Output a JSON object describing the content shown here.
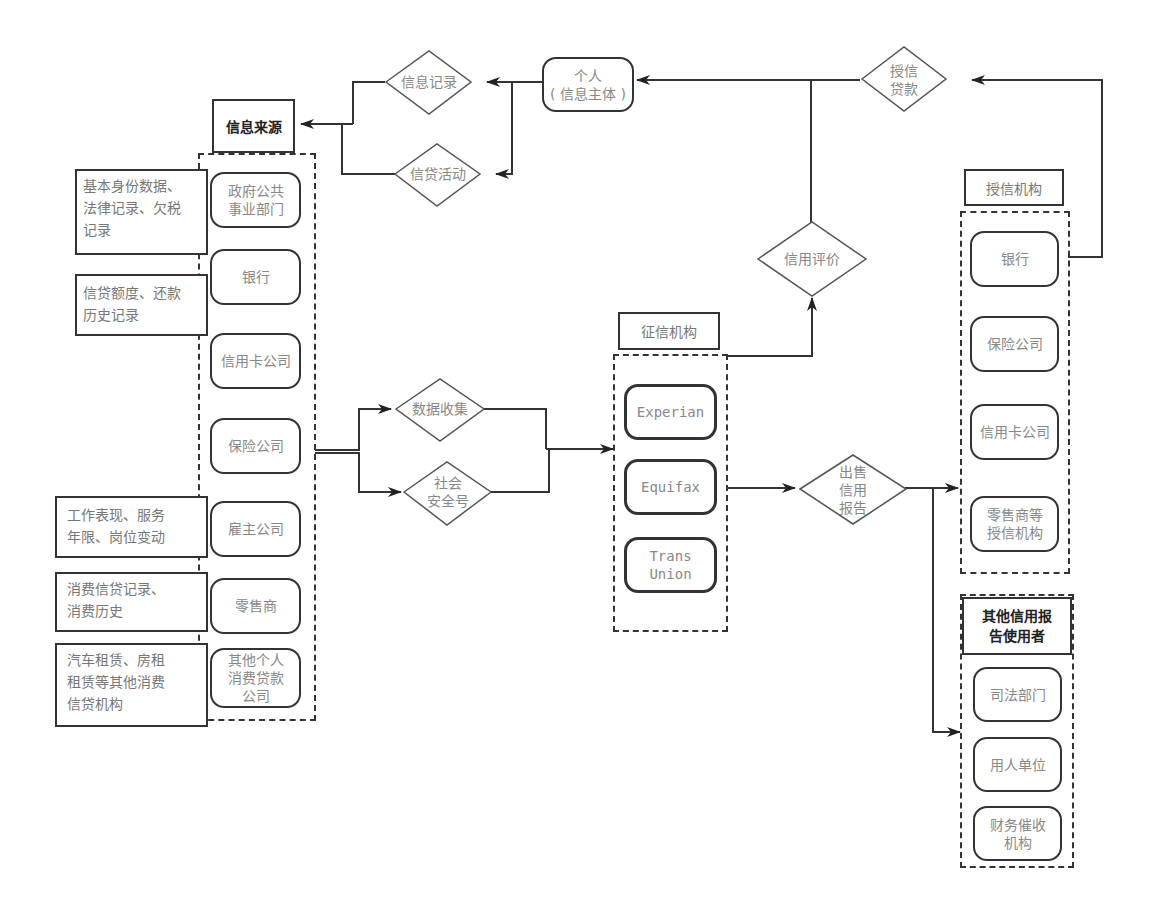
{
  "diagram": {
    "individual": {
      "label": "个人\n( 信息主体 )"
    },
    "decisions": {
      "info_record": "信息记录",
      "credit_activity": "信贷活动",
      "grant_loan": "授信\n贷款",
      "credit_rating": "信用评价",
      "data_collection": "数据收集",
      "ssn": "社会\n安全号",
      "sell_report": "出售\n信用\n报告"
    },
    "info_sources": {
      "title": "信息来源",
      "items": [
        "政府公共\n事业部门",
        "银行",
        "信用卡公司",
        "保险公司",
        "雇主公司",
        "零售商",
        "其他个人\n消费贷款\n公司"
      ],
      "notes": [
        "基本身份数据、\n法律记录、欠税\n记录",
        "信贷额度、还款\n历史记录",
        "工作表现、服务\n年限、岗位变动",
        "消费信贷记录、\n消费历史",
        "汽车租赁、房租\n租赁等其他消费\n信贷机构"
      ]
    },
    "credit_bureaus": {
      "title": "征信机构",
      "items": [
        "Experian",
        "Equifax",
        "Trans\nUnion"
      ]
    },
    "lenders": {
      "title": "授信机构",
      "items": [
        "银行",
        "保险公司",
        "信用卡公司",
        "零售商等\n授信机构"
      ]
    },
    "other_users": {
      "title": "其他信用报\n告使用者",
      "items": [
        "司法部门",
        "用人单位",
        "财务催收\n机构"
      ]
    }
  }
}
